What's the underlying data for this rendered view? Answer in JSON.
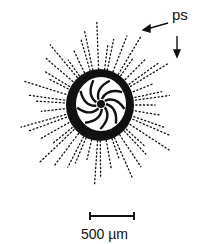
{
  "figure": {
    "labels": {
      "ps": "ps"
    },
    "scale_bar": {
      "label": "500 µm"
    },
    "colors": {
      "ink": "#111111",
      "background": "#ffffff"
    }
  }
}
